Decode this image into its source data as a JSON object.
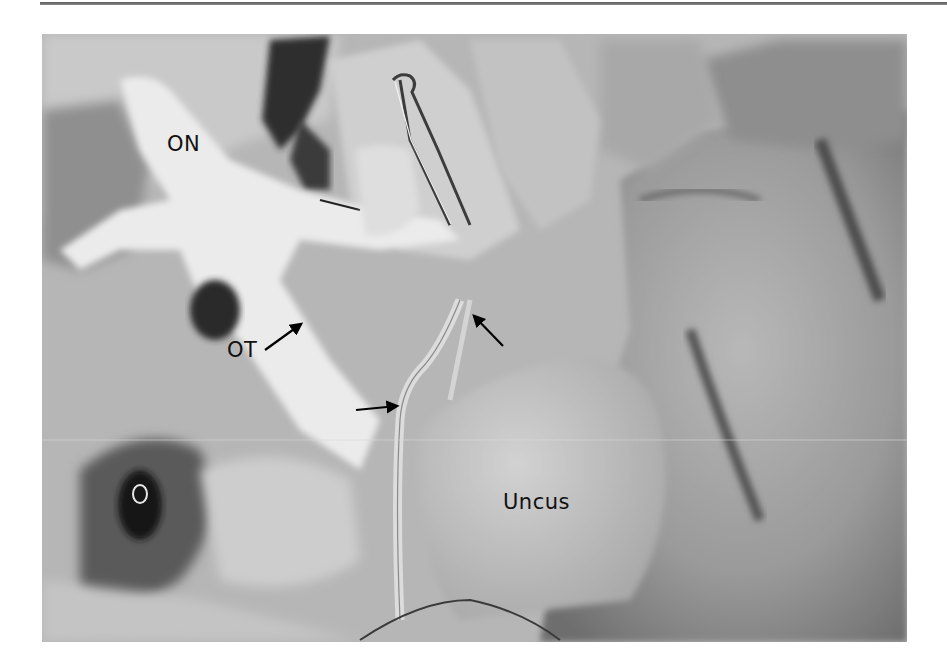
{
  "figure": {
    "type": "grayscale anatomical dissection photograph",
    "labels": [
      {
        "id": "on",
        "text": "ON",
        "x": 167,
        "y": 134
      },
      {
        "id": "ot",
        "text": "OT",
        "x": 227,
        "y": 340
      },
      {
        "id": "uncus",
        "text": "Uncus",
        "x": 503,
        "y": 492
      }
    ],
    "arrows": [
      {
        "id": "ot-arrow",
        "from": [
          265,
          350
        ],
        "to": [
          301,
          324
        ]
      },
      {
        "id": "vessel-arrow-right",
        "from": [
          356,
          410
        ],
        "to": [
          397,
          406
        ]
      },
      {
        "id": "vessel-arrow-upleft",
        "from": [
          503,
          346
        ],
        "to": [
          474,
          316
        ]
      }
    ],
    "colors": {
      "label": "#111111",
      "arrow": "#000000",
      "rule": "#6a6a6a"
    }
  }
}
